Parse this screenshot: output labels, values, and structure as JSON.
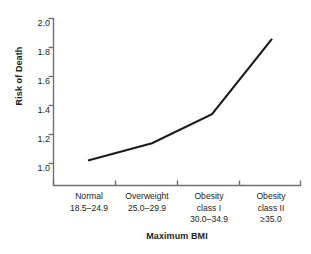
{
  "chart_data": {
    "type": "line",
    "title": "",
    "subtitle": "",
    "xlabel": "Maximum BMI",
    "ylabel": "Risk of Death",
    "categories": [
      "Normal",
      "Overweight",
      "Obesity class I",
      "Obesity class II"
    ],
    "category_lines": [
      [
        "Normal",
        "18.5–24.9"
      ],
      [
        "Overweight",
        "25.0–29.9"
      ],
      [
        "Obesity",
        "class I",
        "30.0–34.9"
      ],
      [
        "Obesity",
        "class II",
        "≥35.0"
      ]
    ],
    "values": [
      1.02,
      1.14,
      1.34,
      1.86
    ],
    "ylim": [
      0.9,
      2.0
    ],
    "yticks": [
      "1.0",
      "1.2",
      "1.4",
      "1.6",
      "1.8",
      "2.0"
    ],
    "ytick_values": [
      1.0,
      1.2,
      1.4,
      1.6,
      1.8,
      2.0
    ],
    "grid": false,
    "legend": "none",
    "series": [
      {
        "name": "Risk of Death",
        "values": [
          1.02,
          1.14,
          1.34,
          1.86
        ],
        "color": "#1a1a1a"
      }
    ]
  },
  "style": {
    "line_color": "#1a1a1a",
    "axis_color": "#6f7072",
    "text_color": "#231f20",
    "background": "#ffffff"
  }
}
